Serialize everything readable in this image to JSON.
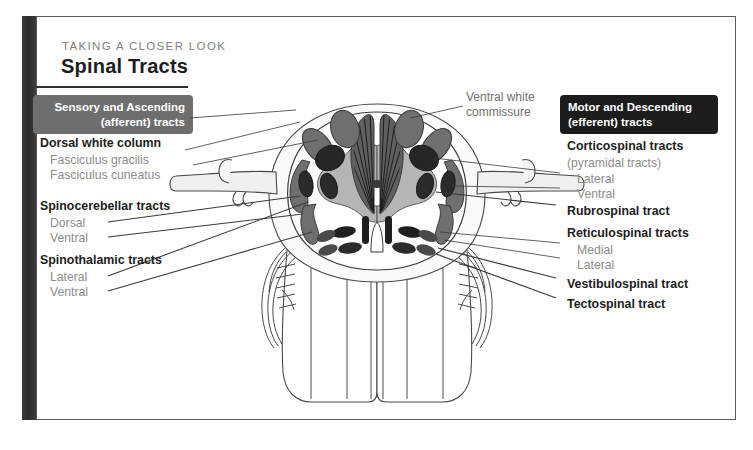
{
  "header": {
    "kicker": "TAKING A CLOSER LOOK",
    "title": "Spinal Tracts"
  },
  "badges": {
    "left": "Sensory and Ascending\n(afferent) tracts",
    "left_line1": "Sensory and Ascending",
    "left_line2": "(afferent) tracts",
    "right_line1": "Motor and Descending",
    "right_line2": "(efferent) tracts"
  },
  "left_labels": [
    {
      "text": "Dorsal white column",
      "style": "main"
    },
    {
      "text": "Fasciculus gracilis",
      "style": "sub"
    },
    {
      "text": "Fasciculus cuneatus",
      "style": "sub"
    },
    {
      "text": "Spinocerebellar tracts",
      "style": "main"
    },
    {
      "text": "Dorsal",
      "style": "sub"
    },
    {
      "text": "Ventral",
      "style": "sub"
    },
    {
      "text": "Spinothalamic tracts",
      "style": "main"
    },
    {
      "text": "Lateral",
      "style": "sub"
    },
    {
      "text": "Ventral",
      "style": "sub"
    }
  ],
  "right_labels": [
    {
      "text": "Corticospinal tracts",
      "style": "main"
    },
    {
      "text": "(pyramidal tracts)",
      "style": "sub"
    },
    {
      "text": "Lateral",
      "style": "sub"
    },
    {
      "text": "Ventral",
      "style": "sub"
    },
    {
      "text": "Rubrospinal tract",
      "style": "main"
    },
    {
      "text": "Reticulospinal tracts",
      "style": "main"
    },
    {
      "text": "Medial",
      "style": "sub"
    },
    {
      "text": "Lateral",
      "style": "sub"
    },
    {
      "text": "Vestibulospinal tract",
      "style": "main"
    },
    {
      "text": "Tectospinal tract",
      "style": "main"
    }
  ],
  "center_note": {
    "line1": "Ventral white",
    "line2": "commissure"
  },
  "colors": {
    "badge_left_bg": "#6e6e6e",
    "badge_right_bg": "#1c1c1c",
    "main_text": "#1d1d1d",
    "sub_text": "#8c8c8c",
    "gray_matter": "#b5b5b5",
    "tract_mid": "#6f6f6f",
    "tract_dark": "#2b2b2b",
    "tract_light": "#9a9a9a",
    "outline": "#4a4a4a",
    "spine_bar": "#333333"
  },
  "diagram": {
    "name": "spinal-cord-cross-section",
    "regions": [
      "dorsal white column",
      "gray matter butterfly",
      "ventral white commissure",
      "dorsal root",
      "ventral root",
      "spinal nerve"
    ]
  }
}
